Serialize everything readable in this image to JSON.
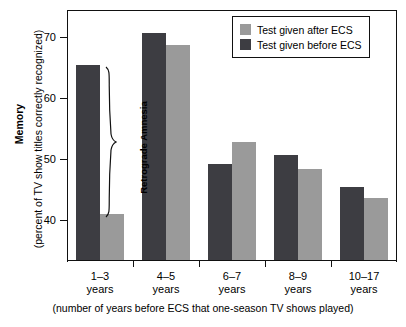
{
  "chart_data": {
    "type": "bar",
    "title": "",
    "categories": [
      "1–3\nyears",
      "4–5\nyears",
      "6–7\nyears",
      "8–9\nyears",
      "10–17\nyears"
    ],
    "category_lines": [
      [
        "1–3",
        "years"
      ],
      [
        "4–5",
        "years"
      ],
      [
        "6–7",
        "years"
      ],
      [
        "8–9",
        "years"
      ],
      [
        "10–17",
        "years"
      ]
    ],
    "series": [
      {
        "name": "Test given before ECS",
        "color": "#3d3d42",
        "values": [
          65.5,
          70.7,
          49.2,
          50.8,
          45.5
        ]
      },
      {
        "name": "Test given after ECS",
        "color": "#9a9a9a",
        "values": [
          41.1,
          68.8,
          52.8,
          48.4,
          43.7
        ]
      }
    ],
    "series_draw_order": [
      "Test given before ECS",
      "Test given after ECS"
    ],
    "ylabel_bold": "Memory",
    "ylabel_sub": "(percent of TV show titles correctly recognized)",
    "xlabel": "(number of years before ECS that one-season TV shows played)",
    "yticks": [
      70,
      60,
      50,
      40
    ],
    "ytick_labels": [
      "70",
      "60",
      "50",
      "40"
    ],
    "ylim": [
      33.5,
      74.5
    ],
    "grid": false,
    "legend_position": "top-right",
    "annotations": [
      {
        "text": "Retrograde Amnesia",
        "type": "brace-label",
        "group": "1–3 years",
        "orientation": "vertical"
      }
    ]
  },
  "legend": {
    "items": [
      {
        "label": "Test given after ECS",
        "color": "#9a9a9a"
      },
      {
        "label": "Test given before ECS",
        "color": "#3d3d42"
      }
    ]
  },
  "axes": {
    "y_title_bold": "Memory",
    "y_title_sub": "(percent of TV show titles correctly recognized)",
    "x_caption": "(number of years before ECS that one-season TV shows played)",
    "y_tick_labels": [
      "70",
      "60",
      "50",
      "40"
    ]
  },
  "annotation": {
    "retrograde_amnesia": "Retrograde Amnesia"
  }
}
